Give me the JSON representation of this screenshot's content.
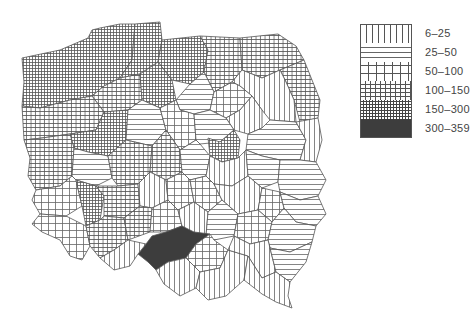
{
  "map": {
    "title": "",
    "subject": "Poland administrative regions choropleth",
    "regions_by_class": {
      "6-25": "vertical-hatch",
      "25-50": "horizontal-hatch",
      "50-100": "coarse-grid",
      "100-150": "medium-grid",
      "150-300": "fine-grid",
      "300-359": "solid-dark"
    }
  },
  "legend": {
    "items": [
      {
        "label": "6–25",
        "pattern": "vertical-lines"
      },
      {
        "label": "25–50",
        "pattern": "horizontal-lines"
      },
      {
        "label": "50–100",
        "pattern": "coarse-grid"
      },
      {
        "label": "100–150",
        "pattern": "medium-grid"
      },
      {
        "label": "150–300",
        "pattern": "fine-grid"
      },
      {
        "label": "300–359",
        "pattern": "solid"
      }
    ]
  },
  "colors": {
    "line": "#555555",
    "dark_fill": "#3d3d3d",
    "background": "#ffffff"
  }
}
